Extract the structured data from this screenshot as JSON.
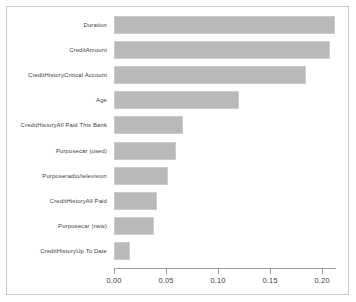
{
  "chart_data": {
    "type": "bar",
    "orientation": "horizontal",
    "title": "",
    "subtitle": "",
    "xlabel": "",
    "ylabel": "",
    "grid": false,
    "legend": false,
    "legend_position": "none",
    "xlim": [
      0.0,
      0.2133
    ],
    "xticks": [
      0.0,
      0.05,
      0.1,
      0.15,
      0.2
    ],
    "xtick_labels": [
      "0.00",
      "0.05",
      "0.10",
      "0.15",
      "0.20"
    ],
    "bar_color": "#b9b9b9",
    "bar_edge_color": "#cdcdcd",
    "axis_color": "#9e9e9e",
    "frame_color": "#c9c9c9",
    "background": "#ffffff",
    "categories": [
      "Duration",
      "CreditAmount",
      "CreditHistoryCritical Account",
      "Age",
      "CreditHistoryAll Paid This Bank",
      "Purposecar (used)",
      "Purposeradio/television",
      "CreditHistoryAll Paid",
      "Purposecar (new)",
      "CreditHistoryUp To Date"
    ],
    "values": [
      0.212,
      0.208,
      0.184,
      0.12,
      0.066,
      0.06,
      0.052,
      0.041,
      0.038,
      0.015
    ],
    "bars": [
      {
        "label": "Duration",
        "value": 0.212
      },
      {
        "label": "CreditAmount",
        "value": 0.208
      },
      {
        "label": "CreditHistoryCritical Account",
        "value": 0.184
      },
      {
        "label": "Age",
        "value": 0.12
      },
      {
        "label": "CreditHistoryAll Paid This Bank",
        "value": 0.066
      },
      {
        "label": "Purposecar (used)",
        "value": 0.06
      },
      {
        "label": "Purposeradio/television",
        "value": 0.052
      },
      {
        "label": "CreditHistoryAll Paid",
        "value": 0.041
      },
      {
        "label": "Purposecar (new)",
        "value": 0.038
      },
      {
        "label": "CreditHistoryUp To Date",
        "value": 0.015
      }
    ]
  }
}
